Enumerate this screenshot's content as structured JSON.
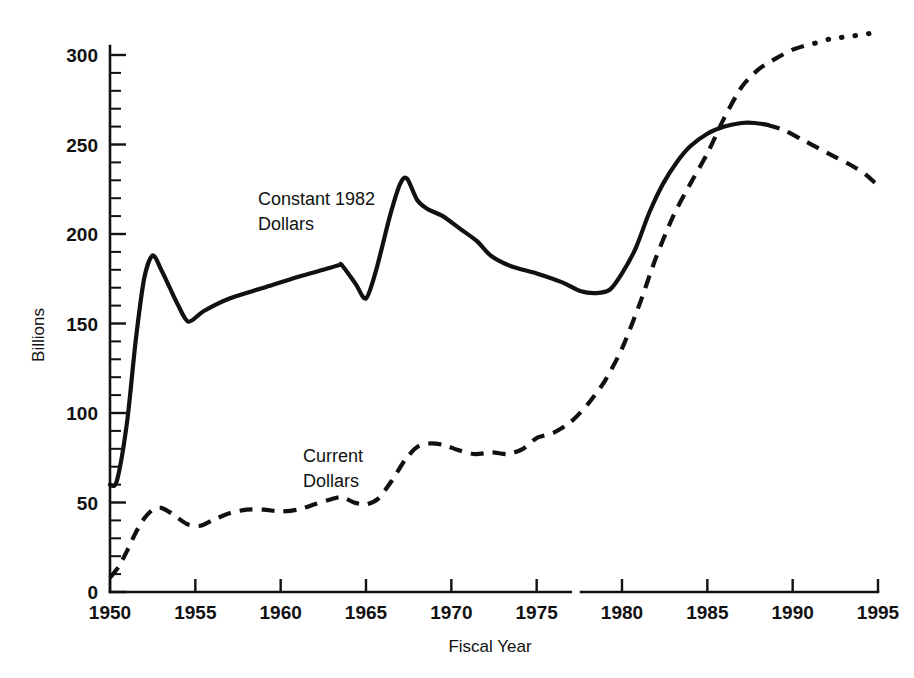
{
  "chart_data": {
    "type": "line",
    "title": "",
    "subtitle": "",
    "xlabel": "Fiscal Year",
    "ylabel": "Billions",
    "xlim": [
      1950,
      1995
    ],
    "ylim": [
      0,
      320
    ],
    "grid": false,
    "legend_position": "inline-annotations",
    "x_ticks": [
      "1950",
      "1955",
      "1960",
      "1965",
      "1970",
      "1975",
      "1980",
      "1985",
      "1990",
      "1995"
    ],
    "x_tick_values": [
      1950,
      1955,
      1960,
      1965,
      1970,
      1975,
      1980,
      1985,
      1990,
      1995
    ],
    "y_ticks": [
      "0",
      "50",
      "100",
      "150",
      "200",
      "250",
      "300"
    ],
    "y_tick_values": [
      0,
      50,
      100,
      150,
      200,
      250,
      300
    ],
    "y_minor_interval": 10,
    "annotations": [
      {
        "text_line1": "Constant 1982",
        "text_line2": "Dollars",
        "x": 1962.0,
        "y": 218
      },
      {
        "text_line1": "Current",
        "text_line2": "Dollars",
        "x": 1964.5,
        "y": 80
      }
    ],
    "series": [
      {
        "name": "Constant 1982 Dollars",
        "style": "solid",
        "projection_style": "dashed",
        "projection_starts_at_x": 1988.5,
        "x": [
          1950,
          1950.4,
          1951,
          1951.5,
          1952,
          1952.5,
          1953,
          1953.5,
          1954,
          1954.6,
          1955.5,
          1957,
          1959,
          1961,
          1962.5,
          1963.4,
          1963.6,
          1964.4,
          1965,
          1965.6,
          1966.4,
          1967,
          1967.4,
          1968,
          1968.6,
          1969.5,
          1970.5,
          1971.5,
          1972.3,
          1973.5,
          1975,
          1976.5,
          1977.6,
          1978.5,
          1979.3,
          1980,
          1980.8,
          1981.6,
          1982.4,
          1983.2,
          1984,
          1985,
          1986,
          1987,
          1987.8,
          1988.5,
          1989.5,
          1990.5,
          1991.5,
          1992.5,
          1993.5,
          1994.3,
          1995
        ],
        "y": [
          60,
          62,
          95,
          140,
          175,
          188,
          180,
          170,
          160,
          151,
          157,
          164,
          170,
          176,
          180,
          182.5,
          182.5,
          172,
          164,
          180,
          210,
          228,
          231,
          219,
          214,
          210,
          203,
          196,
          188,
          182,
          178,
          173,
          168,
          167,
          169,
          178,
          192,
          212,
          228,
          240,
          249,
          256,
          260,
          262,
          262,
          261,
          258,
          253,
          248,
          243,
          238,
          233,
          227
        ]
      },
      {
        "name": "Current Dollars",
        "style": "dashed",
        "projection_style": "dotted",
        "projection_starts_at_x": 1991.3,
        "x": [
          1950,
          1950.5,
          1951,
          1951.5,
          1952,
          1952.5,
          1953,
          1953.6,
          1954.5,
          1955.3,
          1956,
          1957,
          1958,
          1959,
          1960,
          1961,
          1962,
          1963,
          1963.6,
          1964.3,
          1965,
          1965.7,
          1966.5,
          1967.3,
          1968,
          1968.8,
          1969.6,
          1970.5,
          1971.4,
          1972.4,
          1973.3,
          1974.2,
          1975,
          1976,
          1977,
          1978,
          1979,
          1980,
          1981,
          1982,
          1983,
          1984,
          1985,
          1986,
          1987,
          1988,
          1989,
          1990,
          1991,
          1991.5,
          1992.2,
          1993,
          1993.8,
          1994.5,
          1995
        ],
        "y": [
          8,
          14,
          23,
          33,
          41,
          46,
          47,
          44,
          38,
          37,
          40,
          44,
          46,
          46,
          45,
          46,
          49,
          52,
          53,
          50,
          49,
          52,
          62,
          74,
          81,
          83,
          82,
          79,
          77,
          78,
          77,
          80,
          86,
          89,
          95,
          105,
          118,
          136,
          160,
          187,
          210,
          228,
          245,
          265,
          282,
          292,
          298,
          303,
          306,
          307,
          309,
          310,
          311,
          312,
          313
        ]
      }
    ]
  }
}
